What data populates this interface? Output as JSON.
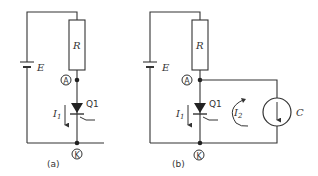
{
  "circuit_a": {
    "caption": "(a)",
    "battery_label": "E",
    "resistor_label": "R",
    "anode_label": "A",
    "cathode_label": "K",
    "thyristor_label": "Q1",
    "current_label": "I",
    "current_sub": "1"
  },
  "circuit_b": {
    "caption": "(b)",
    "battery_label": "E",
    "resistor_label": "R",
    "anode_label": "A",
    "cathode_label": "K",
    "thyristor_label": "Q1",
    "current1_label": "I",
    "current1_sub": "1",
    "current2_label": "I",
    "current2_sub": "2",
    "source_label": "C"
  }
}
